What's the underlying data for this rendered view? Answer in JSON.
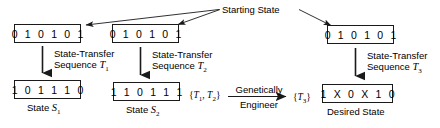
{
  "diagram": {
    "title_label": "Starting State",
    "starting_states": [
      {
        "bits": "0 1 0 1 0 1"
      },
      {
        "bits": "0 1 0 1 0 1"
      },
      {
        "bits": "0 1 0 1 0 1"
      }
    ],
    "transfer_sequences": [
      {
        "line1": "State-Transfer",
        "line2_prefix": "Sequence ",
        "symbol": "T",
        "subscript": "1"
      },
      {
        "line1": "State-Transfer",
        "line2_prefix": "Sequence ",
        "symbol": "T",
        "subscript": "2"
      },
      {
        "line1": "State-Transfer",
        "line2_prefix": "Sequence ",
        "symbol": "T",
        "subscript": "3"
      }
    ],
    "result_states": [
      {
        "bits": "1 0 1 1 1 0",
        "caption_prefix": "State ",
        "caption_symbol": "S",
        "caption_subscript": "1"
      },
      {
        "bits": "1 1 0 1 1 1",
        "caption_prefix": "State ",
        "caption_symbol": "S",
        "caption_subscript": "2"
      },
      {
        "bits": "1 X 0 X 1 0",
        "caption_prefix": "Desired State",
        "caption_symbol": "",
        "caption_subscript": ""
      }
    ],
    "input_set": {
      "open": "{",
      "t1": "T",
      "t1sub": "1",
      "comma": ", ",
      "t2": "T",
      "t2sub": "2",
      "close": "}"
    },
    "output_set": {
      "open": "{",
      "t3": "T",
      "t3sub": "3",
      "close": "}"
    },
    "operation": {
      "line1": "Genetically",
      "line2": "Engineer"
    },
    "colors": {
      "ink": "#1a1a1a",
      "background": "#ffffff"
    }
  }
}
